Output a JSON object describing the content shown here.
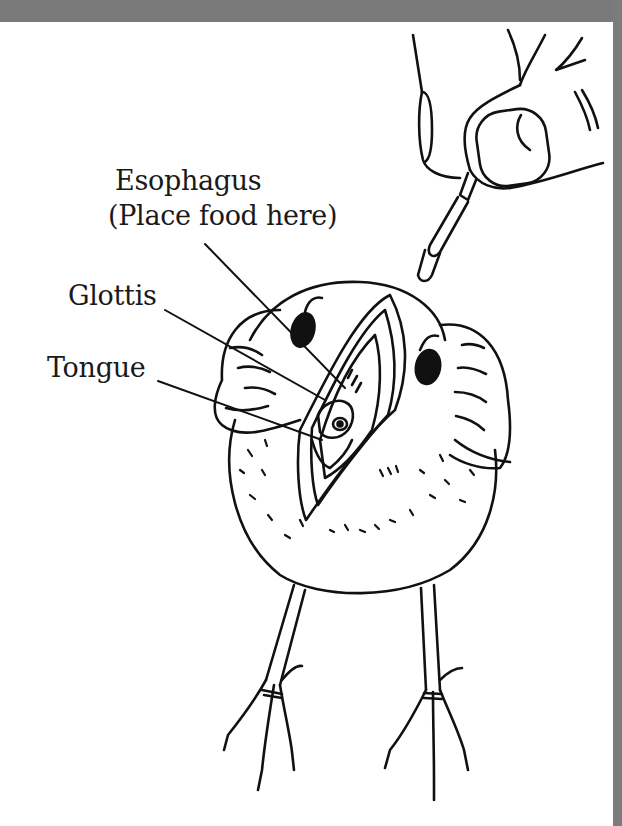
{
  "figure": {
    "labels": {
      "esophagus": "Esophagus",
      "esophagus_note": "(Place food here)",
      "glottis": "Glottis",
      "tongue": "Tongue"
    },
    "colors": {
      "frame_gray": "#7a7a7a",
      "background": "#ffffff",
      "ink": "#111111"
    }
  }
}
